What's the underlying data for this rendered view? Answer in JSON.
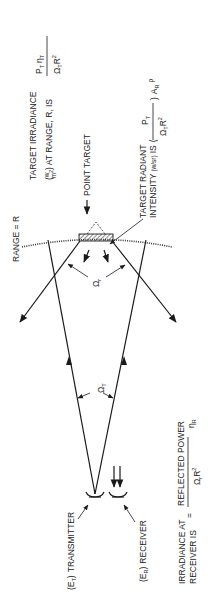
{
  "diagram": {
    "orientation": "rotated -90deg (text reads bottom-to-top)",
    "labels": {
      "target_irradiance_line1": "TARGET IRRADIANCE",
      "target_irradiance_line2_prefix": "(",
      "target_irradiance_units_num": "w",
      "target_irradiance_units_den": "m",
      "target_irradiance_units_den_sup": "2",
      "target_irradiance_line2_suffix": ") AT RANGE, R, IS",
      "target_irradiance_formula_num": "P",
      "target_irradiance_formula_num_sub": "T",
      "target_irradiance_formula_num2": "η",
      "target_irradiance_formula_num2_sub": "T",
      "target_irradiance_formula_den": "Ω",
      "target_irradiance_formula_den_sub": "T",
      "target_irradiance_formula_den2": "R",
      "target_irradiance_formula_den2_sup": "2",
      "point_target": "POINT TARGET",
      "range": "RANGE = R",
      "target_radiant_line1": "TARGET RADIANT",
      "target_radiant_line2": "INTENSITY",
      "target_radiant_units": "(w/sr)",
      "target_radiant_is": "IS",
      "target_radiant_formula_num": "P",
      "target_radiant_formula_num_sub": "T",
      "target_radiant_formula_den": "Ω",
      "target_radiant_formula_den_sub": "T",
      "target_radiant_formula_den2": "R",
      "target_radiant_formula_den2_sup": "2",
      "target_radiant_formula_den2_sub": "R",
      "target_radiant_tail": "A",
      "target_radiant_tail_sub": "R",
      "target_radiant_rho": "ρ",
      "omega_r": "Ω",
      "omega_r_sub": "r",
      "omega_t": "Ω",
      "omega_t_sub": "T",
      "transmitter": "TRANSMITTER",
      "transmitter_sym": "(E",
      "transmitter_sym_sub": "T",
      "transmitter_sym_close": ")",
      "receiver": "RECEIVER",
      "receiver_sym": "(E",
      "receiver_sym_sub": "R",
      "receiver_sym_close": ")",
      "irradiance_receiver_line1": "IRRADIANCE  AT",
      "irradiance_receiver_line2": "RECEIVER IS",
      "equals": "=",
      "reflected_power": "REFLECTED POWER",
      "irr_rec_den": "Ω",
      "irr_rec_den_sub": "r",
      "irr_rec_den2": "R",
      "irr_rec_den2_sup": "2",
      "irr_rec_den2_sub": "R",
      "eta_r": "η",
      "eta_r_sub": "R"
    }
  }
}
